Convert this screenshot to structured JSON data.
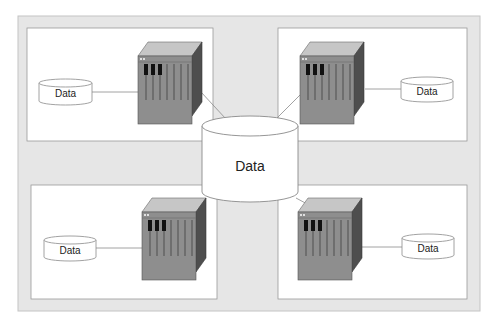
{
  "diagram": {
    "type": "distributed-database-architecture",
    "colors": {
      "frame_fill": "#e6e6e6",
      "frame_stroke": "#c4c4c4",
      "panel_fill": "#ffffff",
      "panel_stroke": "#9a9a9a",
      "rack_front": "#8c8c8c",
      "rack_top": "#c4c4c4",
      "rack_side": "#505050",
      "connector": "#8a8a8a"
    },
    "central_database": {
      "label": "Data",
      "icon": "database-cylinder-icon"
    },
    "sites": [
      {
        "position": "top-left",
        "server_icon": "server-rack-icon",
        "database": {
          "label": "Data",
          "icon": "database-cylinder-icon"
        }
      },
      {
        "position": "top-right",
        "server_icon": "server-rack-icon",
        "database": {
          "label": "Data",
          "icon": "database-cylinder-icon"
        }
      },
      {
        "position": "bottom-left",
        "server_icon": "server-rack-icon",
        "database": {
          "label": "Data",
          "icon": "database-cylinder-icon"
        }
      },
      {
        "position": "bottom-right",
        "server_icon": "server-rack-icon",
        "database": {
          "label": "Data",
          "icon": "database-cylinder-icon"
        }
      }
    ]
  }
}
